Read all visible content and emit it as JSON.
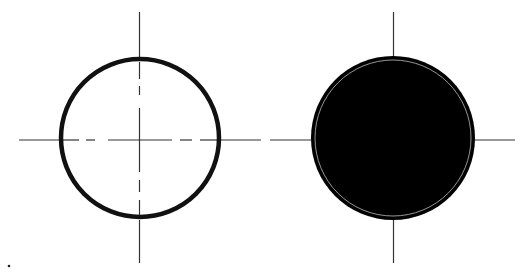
{
  "diagram": {
    "symbols": [
      {
        "name": "open-circle",
        "fill": "none",
        "centerlines_inside": "dashed"
      },
      {
        "name": "filled-circle",
        "fill": "solid",
        "centerlines_inside": "hidden"
      }
    ],
    "colors": {
      "stroke": "#111111",
      "fill": "#000000",
      "centerline": "#333333",
      "inner_ring": "#bbbbbb",
      "background": "#ffffff"
    }
  }
}
